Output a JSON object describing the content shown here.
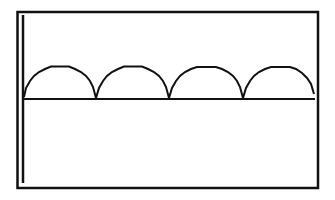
{
  "screen": {
    "type": "calculator-graph-display",
    "background_color": "#ffffff",
    "ink_color": "#111111"
  },
  "graph": {
    "description": "Four adjacent semicircular arches (rectified sine / cycloid-like) sitting on a horizontal x-axis, with a vertical y-axis at the left edge",
    "arch_count": 4,
    "axis": {
      "x_axis_visible": true,
      "y_axis_visible": true
    },
    "arches": [
      {
        "index": 1,
        "start_x": 24,
        "end_x": 96
      },
      {
        "index": 2,
        "start_x": 96,
        "end_x": 169
      },
      {
        "index": 3,
        "start_x": 169,
        "end_x": 243
      },
      {
        "index": 4,
        "start_x": 243,
        "end_x": 314
      }
    ]
  }
}
